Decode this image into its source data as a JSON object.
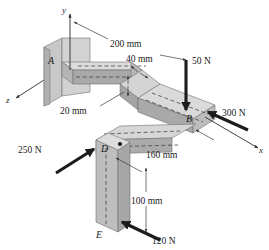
{
  "figure": {
    "background_color": "#ffffff"
  },
  "axes": [
    {
      "name": "y-axis",
      "label": "y",
      "direction": "up"
    },
    {
      "name": "x-axis",
      "label": "x",
      "direction": "lower-right"
    },
    {
      "name": "z-axis",
      "label": "z",
      "direction": "lower-left"
    }
  ],
  "points": [
    {
      "id": "A",
      "label": "A",
      "description": "fixed support at wall plate"
    },
    {
      "id": "B",
      "label": "B",
      "description": "corner at far end of top beam"
    },
    {
      "id": "D",
      "label": "D",
      "description": "top of vertical post"
    },
    {
      "id": "E",
      "label": "E",
      "description": "bottom of vertical post"
    }
  ],
  "forces": [
    {
      "id": "f50",
      "label": "50 N",
      "magnitude": 50,
      "unit": "N",
      "direction": "downward",
      "applied_at": "B"
    },
    {
      "id": "f300",
      "label": "300 N",
      "magnitude": 300,
      "unit": "N",
      "direction": "up-left",
      "applied_at": "B"
    },
    {
      "id": "f250",
      "label": "250 N",
      "magnitude": 250,
      "unit": "N",
      "direction": "up-right",
      "applied_at": "D"
    },
    {
      "id": "f120",
      "label": "120 N",
      "magnitude": 120,
      "unit": "N",
      "direction": "up-left",
      "applied_at": "E"
    }
  ],
  "dimensions": [
    {
      "id": "d200",
      "label": "200 mm",
      "value": 200,
      "unit": "mm",
      "spans": "y-axis to 50 N line"
    },
    {
      "id": "d40",
      "label": "40 mm",
      "value": 40,
      "unit": "mm",
      "spans": "beam width"
    },
    {
      "id": "d20",
      "label": "20 mm",
      "value": 20,
      "unit": "mm",
      "spans": "beam thickness"
    },
    {
      "id": "d160",
      "label": "160 mm",
      "value": 160,
      "unit": "mm",
      "spans": "D to B horizontal"
    },
    {
      "id": "d100",
      "label": "100 mm",
      "value": 100,
      "unit": "mm",
      "spans": "D to E vertical"
    }
  ],
  "colors": {
    "top_face": "#d8d8d8",
    "front_face": "#a8a8a8",
    "side_face": "#bcbcbc",
    "wall_plate": "#c4c4c4",
    "outline": "#6f6f6f",
    "arrow": "#1c1c1c",
    "dimension": "#3a3a3a"
  }
}
